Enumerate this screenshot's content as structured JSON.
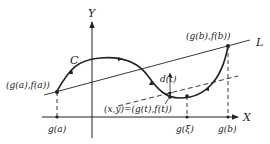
{
  "diagram": {
    "axes": {
      "x_label": "X",
      "y_label": "Y"
    },
    "curve_label": "C",
    "line_label": "L",
    "points": {
      "start": "(g(a),f(a))",
      "end": "(g(b),f(b))",
      "moving": "(x,y)=(g(t),f(t))"
    },
    "distance_label": "d(t)",
    "x_ticks": [
      "g(a)",
      "g(ξ)",
      "g(b)"
    ],
    "colors": {
      "stroke": "#222222",
      "background": "#ffffff"
    }
  }
}
